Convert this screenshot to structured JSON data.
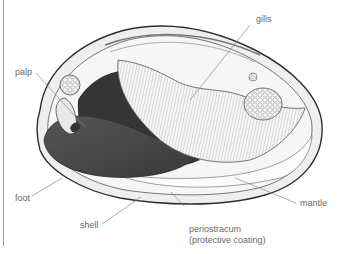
{
  "diagram": {
    "labels": {
      "gills": "gills",
      "palp": "palp",
      "foot": "foot",
      "shell": "shell",
      "periostracum_line1": "periostracum",
      "periostracum_line2": "(protective coating)",
      "mantle": "mantle"
    },
    "colors": {
      "background": "#ffffff",
      "shell_fill": "#f1f1f1",
      "shell_outline": "#3a3a3a",
      "foot_fill": "#4a4a4a",
      "visceral_mass": "#333333",
      "gill_fill": "#f4f4f4",
      "leader_lines": "#8a8a8a",
      "label_text": "#6a6a6a"
    }
  }
}
